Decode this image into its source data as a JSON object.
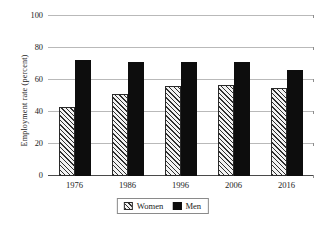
{
  "chart_data": {
    "type": "bar",
    "title": "",
    "xlabel": "",
    "ylabel": "Employment rate (percent)",
    "categories": [
      "1976",
      "1986",
      "1996",
      "2006",
      "2016"
    ],
    "series": [
      {
        "name": "Women",
        "values": [
          43,
          51.5,
          56,
          57,
          55
        ]
      },
      {
        "name": "Men",
        "values": [
          72.5,
          71.5,
          71.5,
          71,
          66
        ]
      }
    ],
    "ylim": [
      0,
      100
    ],
    "yticks": [
      0,
      20,
      40,
      60,
      80,
      100
    ],
    "ytick_labels": [
      "0",
      "20",
      "40",
      "60",
      "80",
      "100"
    ],
    "grid": true,
    "legend_position": "bottom-center",
    "legend": [
      "Women",
      "Men"
    ],
    "colors": {
      "women_fill": "#f2f2f2",
      "women_hatch": "#2e2e2e",
      "men_fill": "#0d0d0d",
      "gridline": "#b9b9b9",
      "axis": "#4a4a4a",
      "text": "#1c1c1c",
      "background": "#ffffff"
    }
  }
}
